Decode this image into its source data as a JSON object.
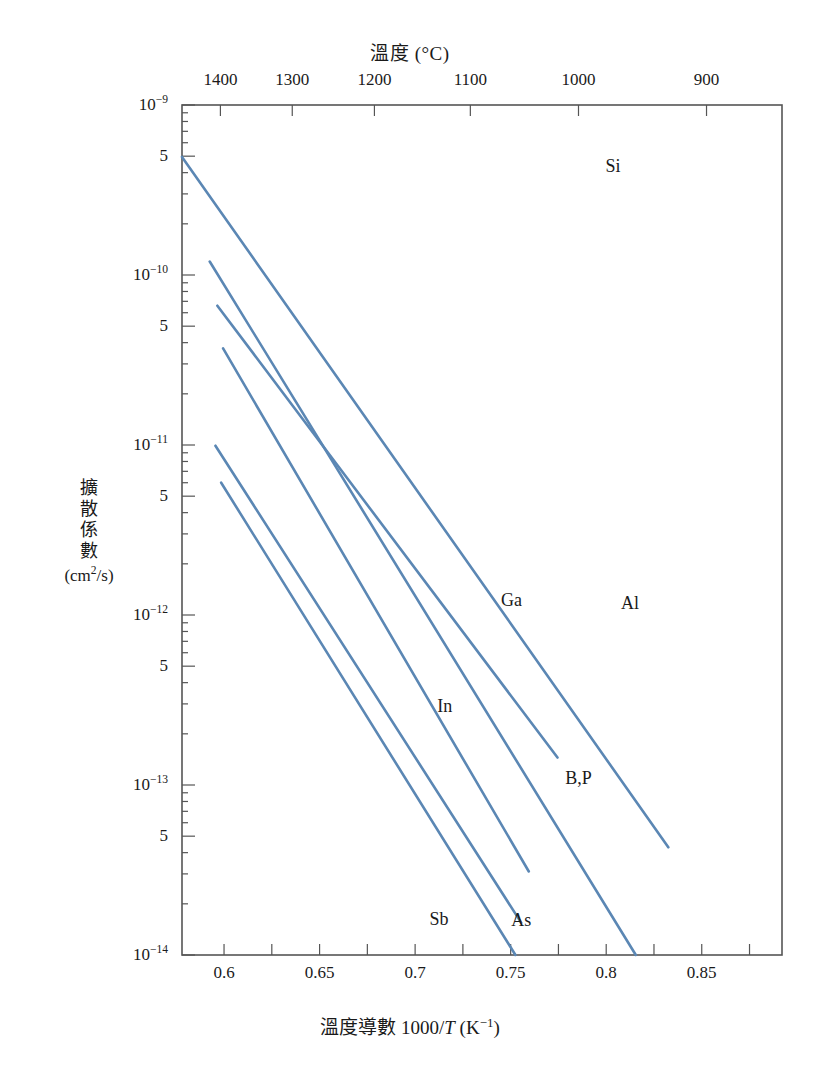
{
  "figure": {
    "top_axis_title_cjk": "溫度",
    "top_axis_title_unit": " (°C)",
    "bottom_axis_title_cjk": "溫度導數 ",
    "bottom_axis_title_expr": "1000/",
    "bottom_axis_title_var": "T",
    "bottom_axis_title_unit": " (K",
    "bottom_axis_title_unit_sup": "−1",
    "bottom_axis_title_unit_end": ")",
    "y_axis_title_chars": [
      "擴",
      "散",
      "係",
      "數"
    ],
    "y_axis_title_units": "(cm2/s)",
    "y_axis_title_units_base": "(cm",
    "y_axis_title_units_sup": "2",
    "y_axis_title_units_tail": "/s)",
    "material_annotation": "Si",
    "line_color": "#5b87b4",
    "axis_color": "#555555",
    "text_color": "#1a1a1a"
  },
  "chart_data": {
    "type": "line",
    "xlabel": "溫度導數 1000/T (K−1)",
    "ylabel": "擴散係數 (cm2/s)",
    "xlim": [
      0.578,
      0.892
    ],
    "ylim": [
      1e-14,
      1e-09
    ],
    "yscale": "log",
    "grid": false,
    "legend": "inline-labels",
    "x_ticks_major": [
      0.6,
      0.65,
      0.7,
      0.75,
      0.8,
      0.85
    ],
    "x_tick_labels": [
      "0.6",
      "0.65",
      "0.7",
      "0.75",
      "0.8",
      "0.85"
    ],
    "x_ticks_minor_step": 0.025,
    "y_ticks_major": [
      1e-09,
      1e-10,
      1e-11,
      1e-12,
      1e-13,
      1e-14
    ],
    "y_tick_labels": [
      "10−9",
      "10−10",
      "10−11",
      "10−12",
      "10−13",
      "10−14"
    ],
    "y_ticks_mid": [
      5e-10,
      5e-11,
      5e-12,
      5e-13,
      5e-14
    ],
    "y_tick_mid_label": "5",
    "top_axis": {
      "label": "溫度 (°C)",
      "tick_values_celsius": [
        1400,
        1300,
        1200,
        1100,
        1000,
        900
      ],
      "tick_labels": [
        "1400",
        "1300",
        "1200",
        "1100",
        "1000",
        "900"
      ],
      "tick_positions_x": [
        0.5981,
        0.6357,
        0.6787,
        0.7289,
        0.7855,
        0.8525
      ]
    },
    "series": [
      {
        "name": "Al",
        "label": "Al",
        "x": [
          0.578,
          0.8325
        ],
        "y": [
          4.95e-10,
          4.3e-14
        ],
        "label_pos": {
          "x": 0.8125,
          "y": 1.18e-12
        }
      },
      {
        "name": "B,P",
        "label": "B,P",
        "x": [
          0.5925,
          0.8155
        ],
        "y": [
          1.2e-10,
          1e-14
        ],
        "label_pos": {
          "x": 0.7855,
          "y": 1.1e-13
        }
      },
      {
        "name": "Ga",
        "label": "Ga",
        "x": [
          0.5965,
          0.7745
        ],
        "y": [
          6.6e-11,
          1.45e-13
        ],
        "label_pos": {
          "x": 0.7505,
          "y": 1.22e-12
        }
      },
      {
        "name": "In",
        "label": "In",
        "x": [
          0.5995,
          0.7595
        ],
        "y": [
          3.7e-11,
          3.1e-14
        ],
        "label_pos": {
          "x": 0.7155,
          "y": 2.9e-13
        }
      },
      {
        "name": "As",
        "label": "As",
        "x": [
          0.5955,
          0.7555
        ],
        "y": [
          9.9e-12,
          1.55e-14
        ],
        "label_pos": {
          "x": 0.7555,
          "y": 1.6e-14
        }
      },
      {
        "name": "Sb",
        "label": "Sb",
        "x": [
          0.5985,
          0.7525
        ],
        "y": [
          6e-12,
          1e-14
        ],
        "label_pos": {
          "x": 0.7125,
          "y": 1.62e-14
        }
      }
    ],
    "annotations": [
      {
        "text": "Si",
        "x": 0.8035,
        "y": 4.4e-10
      }
    ]
  }
}
